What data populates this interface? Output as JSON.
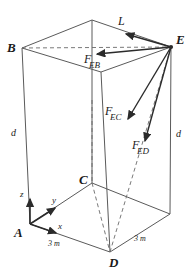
{
  "figure": {
    "type": "engineering-free-body-diagram",
    "stroke_color": "#555555",
    "vector_color": "#2b2b2b",
    "text_color": "#1a1a1a",
    "background": "#ffffff"
  },
  "vertices": [
    {
      "name": "A",
      "label": "A",
      "x": 30,
      "y": 224,
      "lx": 16,
      "ly": 228
    },
    {
      "name": "B",
      "label": "B",
      "x": 22,
      "y": 48,
      "lx": 8,
      "ly": 44
    },
    {
      "name": "C",
      "label": "C",
      "x": 92,
      "y": 183,
      "lx": 80,
      "ly": 176
    },
    {
      "name": "D",
      "label": "D",
      "x": 110,
      "y": 252,
      "lx": 110,
      "ly": 258
    },
    {
      "name": "E",
      "label": "E",
      "x": 171,
      "y": 47,
      "lx": 176,
      "ly": 34
    }
  ],
  "dimensions": [
    {
      "name": "height-left",
      "label": "d",
      "x": 10,
      "y": 130
    },
    {
      "name": "height-right",
      "label": "d",
      "x": 175,
      "y": 131
    },
    {
      "name": "base-front",
      "label": "3 m",
      "x": 48,
      "y": 240
    },
    {
      "name": "base-right",
      "label": "3 m",
      "x": 134,
      "y": 235
    }
  ],
  "axes": {
    "origin_label": "A",
    "items": [
      {
        "name": "z-axis",
        "label": "z",
        "lx": 20,
        "ly": 192
      },
      {
        "name": "y-axis",
        "label": "y",
        "lx": 52,
        "ly": 198
      },
      {
        "name": "x-axis",
        "label": "x",
        "lx": 58,
        "ly": 224
      }
    ]
  },
  "forces": [
    {
      "name": "L",
      "main": "L",
      "sub": "",
      "lx": 118,
      "ly": 17
    },
    {
      "name": "F_EB",
      "main": "F",
      "sub": "EB",
      "lx": 84,
      "ly": 56
    },
    {
      "name": "F_EC",
      "main": "F",
      "sub": "EC",
      "lx": 107,
      "ly": 108
    },
    {
      "name": "F_ED",
      "main": "F",
      "sub": "ED",
      "lx": 133,
      "ly": 142
    }
  ]
}
